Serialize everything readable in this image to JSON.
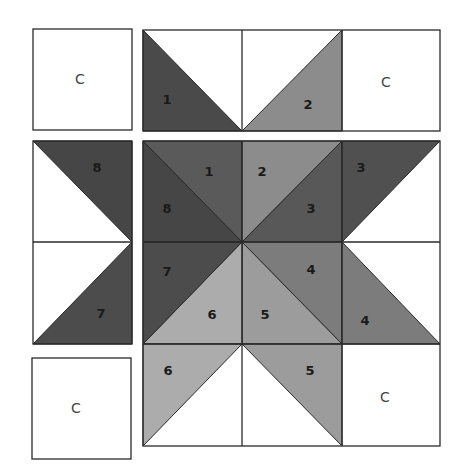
{
  "diagram": {
    "colors": {
      "white": "#ffffff",
      "piece_1": "#5a5a5a",
      "piece_1_outer": "#4a4a4a",
      "piece_2": "#8c8c8c",
      "piece_3": "#585858",
      "piece_3_outer": "#505050",
      "piece_4": "#7c7c7c",
      "piece_5": "#9c9c9c",
      "piece_6": "#acacac",
      "piece_7": "#4c4c4c",
      "piece_8": "#464646",
      "outline": "#2a2a2a"
    },
    "corner_squares": [
      {
        "id": "top-left",
        "label": "C"
      },
      {
        "id": "top-right",
        "label": "C"
      },
      {
        "id": "bottom-left",
        "label": "C"
      },
      {
        "id": "bottom-right",
        "label": "C"
      }
    ],
    "pieces": {
      "top_strip": [
        {
          "label": "1"
        },
        {
          "label": "2"
        }
      ],
      "left_strip": [
        {
          "label": "8"
        },
        {
          "label": "7"
        }
      ],
      "center": [
        {
          "label": "1"
        },
        {
          "label": "2"
        },
        {
          "label": "8"
        },
        {
          "label": "3"
        },
        {
          "label": "7"
        },
        {
          "label": "4"
        },
        {
          "label": "6"
        },
        {
          "label": "5"
        }
      ],
      "right_column": [
        {
          "label": "3"
        },
        {
          "label": "4"
        }
      ],
      "bottom_row": [
        {
          "label": "6"
        },
        {
          "label": "5"
        }
      ]
    }
  }
}
